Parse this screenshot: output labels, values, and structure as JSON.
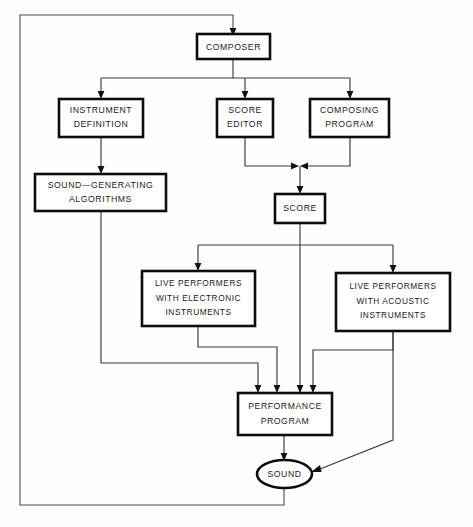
{
  "diagram": {
    "type": "flowchart",
    "canvas": {
      "width": 473,
      "height": 527
    },
    "style": {
      "node_fill": "#ffffff",
      "node_stroke": "#0d0d0d",
      "edge_stroke": "#3a3a3a",
      "text_color": "#1a1a1a",
      "background": "#fefefe"
    },
    "nodes": [
      {
        "id": "composer",
        "shape": "rect",
        "label": "COMPOSER",
        "lines": [
          "COMPOSER"
        ]
      },
      {
        "id": "instrument",
        "shape": "rect",
        "label": "INSTRUMENT DEFINITION",
        "lines": [
          "INSTRUMENT",
          "DEFINITION"
        ]
      },
      {
        "id": "scoreeditor",
        "shape": "rect",
        "label": "SCORE EDITOR",
        "lines": [
          "SCORE",
          "EDITOR"
        ]
      },
      {
        "id": "composing",
        "shape": "rect",
        "label": "COMPOSING PROGRAM",
        "lines": [
          "COMPOSING",
          "PROGRAM"
        ]
      },
      {
        "id": "soundgen",
        "shape": "rect",
        "label": "SOUND-GENERATING ALGORITHMS",
        "lines": [
          "SOUND—GENERATING",
          "ALGORITHMS"
        ]
      },
      {
        "id": "score",
        "shape": "rect",
        "label": "SCORE",
        "lines": [
          "SCORE"
        ]
      },
      {
        "id": "electronic",
        "shape": "rect",
        "label": "LIVE PERFORMERS WITH ELECTRONIC INSTRUMENTS",
        "lines": [
          "LIVE PERFORMERS",
          "WITH ELECTRONIC",
          "INSTRUMENTS"
        ]
      },
      {
        "id": "acoustic",
        "shape": "rect",
        "label": "LIVE PERFORMERS WITH ACOUSTIC INSTRUMENTS",
        "lines": [
          "LIVE PERFORMERS",
          "WITH ACOUSTIC",
          "INSTRUMENTS"
        ]
      },
      {
        "id": "performance",
        "shape": "rect",
        "label": "PERFORMANCE PROGRAM",
        "lines": [
          "PERFORMANCE",
          "PROGRAM"
        ]
      },
      {
        "id": "sound",
        "shape": "ellipse",
        "label": "SOUND",
        "lines": [
          "SOUND"
        ]
      }
    ],
    "edges": [
      {
        "from": "composer",
        "to": "instrument",
        "arrow": true
      },
      {
        "from": "composer",
        "to": "scoreeditor",
        "arrow": true
      },
      {
        "from": "composer",
        "to": "composing",
        "arrow": true
      },
      {
        "from": "instrument",
        "to": "soundgen",
        "arrow": true
      },
      {
        "from": "scoreeditor",
        "to": "score",
        "arrow": true
      },
      {
        "from": "composing",
        "to": "score",
        "arrow": true
      },
      {
        "from": "score",
        "to": "electronic",
        "arrow": true
      },
      {
        "from": "score",
        "to": "acoustic",
        "arrow": true
      },
      {
        "from": "score",
        "to": "performance",
        "arrow": true
      },
      {
        "from": "soundgen",
        "to": "performance",
        "arrow": true
      },
      {
        "from": "electronic",
        "to": "performance",
        "arrow": true
      },
      {
        "from": "acoustic",
        "to": "performance",
        "arrow": true
      },
      {
        "from": "performance",
        "to": "sound",
        "arrow": true
      },
      {
        "from": "acoustic",
        "to": "sound",
        "arrow": true
      },
      {
        "from": "sound",
        "to": "composer",
        "arrow": true,
        "note": "feedback loop around left side"
      }
    ]
  },
  "labels": {
    "composer": "COMPOSER",
    "instrument_1": "INSTRUMENT",
    "instrument_2": "DEFINITION",
    "scoreeditor_1": "SCORE",
    "scoreeditor_2": "EDITOR",
    "composing_1": "COMPOSING",
    "composing_2": "PROGRAM",
    "soundgen_1": "SOUND—GENERATING",
    "soundgen_2": "ALGORITHMS",
    "score": "SCORE",
    "electronic_1": "LIVE PERFORMERS",
    "electronic_2": "WITH ELECTRONIC",
    "electronic_3": "INSTRUMENTS",
    "acoustic_1": "LIVE PERFORMERS",
    "acoustic_2": "WITH ACOUSTIC",
    "acoustic_3": "INSTRUMENTS",
    "performance_1": "PERFORMANCE",
    "performance_2": "PROGRAM",
    "sound": "SOUND"
  }
}
